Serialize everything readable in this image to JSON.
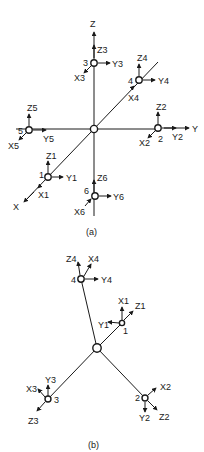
{
  "figure_a": {
    "caption": "(a)",
    "global_axes": {
      "x": "X",
      "y": "Y",
      "z": "Z"
    },
    "nodes": [
      {
        "id": "1",
        "axes": [
          "X1",
          "Y1",
          "Z1"
        ]
      },
      {
        "id": "2",
        "axes": [
          "X2",
          "Y2",
          "Z2"
        ]
      },
      {
        "id": "3",
        "axes": [
          "X3",
          "Y3",
          "Z3"
        ]
      },
      {
        "id": "4",
        "axes": [
          "X4",
          "Y4",
          "Z4"
        ]
      },
      {
        "id": "5",
        "axes": [
          "X5",
          "Y5",
          "Z5"
        ]
      },
      {
        "id": "6",
        "axes": [
          "X6",
          "Y6",
          "Z6"
        ]
      }
    ]
  },
  "figure_b": {
    "caption": "(b)",
    "nodes": [
      {
        "id": "1",
        "axes": [
          "X1",
          "Y1",
          "Z1"
        ]
      },
      {
        "id": "2",
        "axes": [
          "X2",
          "Y2",
          "Z2"
        ]
      },
      {
        "id": "3",
        "axes": [
          "X3",
          "Y3",
          "Z3"
        ]
      },
      {
        "id": "4",
        "axes": [
          "X4",
          "Y4",
          "Z4"
        ]
      }
    ]
  },
  "colors": {
    "ink": "#1a1a1a",
    "background": "#ffffff"
  }
}
